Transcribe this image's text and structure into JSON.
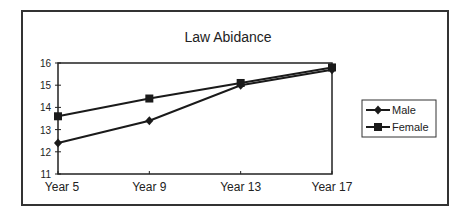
{
  "chart_data": {
    "type": "line",
    "title": "Law Abidance",
    "xlabel": "",
    "ylabel": "",
    "categories": [
      "Year 5",
      "Year 9",
      "Year 13",
      "Year 17"
    ],
    "series": [
      {
        "name": "Male",
        "marker": "diamond",
        "values": [
          12.4,
          13.4,
          15.0,
          15.7
        ]
      },
      {
        "name": "Female",
        "marker": "square",
        "values": [
          13.6,
          14.4,
          15.1,
          15.8
        ]
      }
    ],
    "ylim": [
      11,
      16
    ],
    "yticks": [
      11,
      12,
      13,
      14,
      15,
      16
    ],
    "grid": false,
    "legend_position": "right"
  },
  "colors": {
    "line": "#1a1a1a",
    "frame": "#333333",
    "background": "#ffffff"
  }
}
